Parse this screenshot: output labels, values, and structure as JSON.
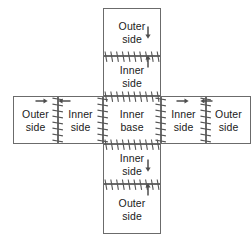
{
  "diagram": {
    "stroke_color": "#6b6b6b",
    "text_color": "#1a1a1a",
    "teeth_color": "#555555",
    "arrow_color": "#4d4d4d",
    "cells": [
      {
        "id": "top-outer-side",
        "label": "Outer\nside",
        "x": 103,
        "y": 8,
        "w": 58,
        "h": 48
      },
      {
        "id": "top-inner-side",
        "label": "Inner\nside",
        "x": 103,
        "y": 56,
        "w": 58,
        "h": 40
      },
      {
        "id": "left-outer-side",
        "label": "Outer\nside",
        "x": 13,
        "y": 96,
        "w": 45,
        "h": 48
      },
      {
        "id": "left-inner-side",
        "label": "Inner\nside",
        "x": 58,
        "y": 96,
        "w": 45,
        "h": 48
      },
      {
        "id": "center-inner-base",
        "label": "Inner\nbase",
        "x": 103,
        "y": 96,
        "w": 58,
        "h": 48
      },
      {
        "id": "right-inner-side",
        "label": "Inner\nside",
        "x": 161,
        "y": 96,
        "w": 45,
        "h": 48
      },
      {
        "id": "right-outer-side",
        "label": "Outer\nside",
        "x": 206,
        "y": 96,
        "w": 45,
        "h": 48
      },
      {
        "id": "bottom-inner-side",
        "label": "Inner\nside",
        "x": 103,
        "y": 144,
        "w": 58,
        "h": 40
      },
      {
        "id": "bottom-outer-side",
        "label": "Outer\nside",
        "x": 103,
        "y": 184,
        "w": 58,
        "h": 50
      }
    ],
    "seams": [
      {
        "id": "seam-top-outer-inner",
        "orientation": "horizontal",
        "x": 103,
        "y": 56,
        "length": 58
      },
      {
        "id": "seam-top-inner-base",
        "orientation": "horizontal",
        "x": 103,
        "y": 96,
        "length": 58
      },
      {
        "id": "seam-base-bottom-inner",
        "orientation": "horizontal",
        "x": 103,
        "y": 144,
        "length": 58
      },
      {
        "id": "seam-bottom-inner-outer",
        "orientation": "horizontal",
        "x": 103,
        "y": 184,
        "length": 58
      },
      {
        "id": "seam-left-outer-inner",
        "orientation": "vertical",
        "x": 58,
        "y": 96,
        "length": 48
      },
      {
        "id": "seam-left-inner-base",
        "orientation": "vertical",
        "x": 103,
        "y": 96,
        "length": 48
      },
      {
        "id": "seam-base-right-inner",
        "orientation": "vertical",
        "x": 161,
        "y": 96,
        "length": 48
      },
      {
        "id": "seam-right-inner-outer",
        "orientation": "vertical",
        "x": 206,
        "y": 96,
        "length": 48
      }
    ],
    "arrows": [
      {
        "id": "arrow-top-outer-down",
        "direction": "down",
        "x": 148,
        "y": 32
      },
      {
        "id": "arrow-top-inner-up",
        "direction": "up",
        "x": 148,
        "y": 62
      },
      {
        "id": "arrow-left-outer-right",
        "direction": "right",
        "x": 41,
        "y": 101
      },
      {
        "id": "arrow-left-inner-left",
        "direction": "left",
        "x": 65,
        "y": 101
      },
      {
        "id": "arrow-right-inner-right",
        "direction": "right",
        "x": 182,
        "y": 101
      },
      {
        "id": "arrow-right-outer-left",
        "direction": "left",
        "x": 207,
        "y": 101
      },
      {
        "id": "arrow-bottom-inner-down",
        "direction": "down",
        "x": 148,
        "y": 165
      },
      {
        "id": "arrow-bottom-outer-up",
        "direction": "up",
        "x": 148,
        "y": 190
      }
    ]
  }
}
